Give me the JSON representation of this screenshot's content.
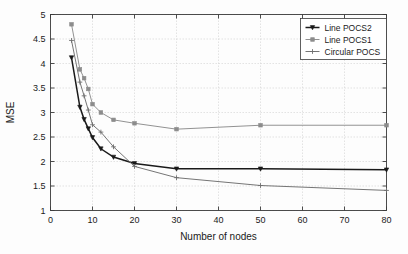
{
  "chart_data": {
    "type": "line",
    "title": "",
    "xlabel": "Number of nodes",
    "ylabel": "MSE",
    "xlim": [
      0,
      80
    ],
    "ylim": [
      1,
      5
    ],
    "xticks": [
      0,
      10,
      20,
      30,
      40,
      50,
      60,
      70,
      80
    ],
    "xticklabels": [
      "0",
      "10",
      "20",
      "30",
      "40",
      "50",
      "60",
      "70",
      "80"
    ],
    "yticks": [
      1,
      1.5,
      2,
      2.5,
      3,
      3.5,
      4,
      4.5,
      5
    ],
    "yticklabels": [
      "1",
      "1.5",
      "2",
      "2.5",
      "3",
      "3.5",
      "4",
      "4.5",
      "5"
    ],
    "grid": true,
    "legend_position": "upper right",
    "series": [
      {
        "name": "Line POCS2",
        "color": "#1a1a1a",
        "marker": "triangle-down",
        "x": [
          5,
          7,
          8,
          9,
          10,
          12,
          15,
          20,
          30,
          50,
          80
        ],
        "y": [
          4.12,
          3.11,
          2.86,
          2.67,
          2.49,
          2.26,
          2.09,
          1.96,
          1.85,
          1.85,
          1.83
        ]
      },
      {
        "name": "Line POCS1",
        "color": "#8c8c8c",
        "marker": "square",
        "x": [
          5,
          7,
          8,
          9,
          10,
          12,
          15,
          20,
          30,
          50,
          80
        ],
        "y": [
          4.8,
          3.88,
          3.7,
          3.48,
          3.17,
          3.0,
          2.85,
          2.78,
          2.66,
          2.74,
          2.74
        ]
      },
      {
        "name": "Circular POCS",
        "color": "#6e6e6e",
        "marker": "plus",
        "x": [
          5,
          7,
          8,
          9,
          10,
          12,
          15,
          20,
          30,
          50,
          80
        ],
        "y": [
          4.47,
          3.62,
          3.34,
          3.05,
          2.75,
          2.6,
          2.3,
          1.9,
          1.67,
          1.51,
          1.41
        ]
      }
    ]
  },
  "legend": {
    "entries": [
      {
        "label": "Line POCS2"
      },
      {
        "label": "Line POCS1"
      },
      {
        "label": "Circular POCS"
      }
    ]
  },
  "axes": {
    "x_title": "Number of nodes",
    "y_title": "MSE"
  }
}
